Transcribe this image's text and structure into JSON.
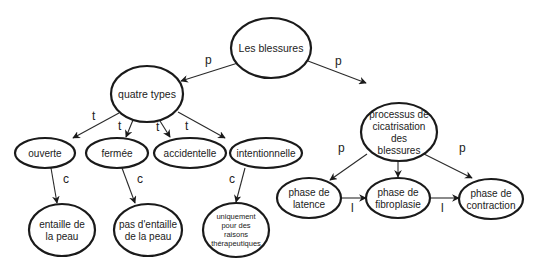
{
  "diagram": {
    "type": "concept-map",
    "nodes": [
      {
        "id": "root",
        "lines": [
          "Les blessures"
        ],
        "cx": 271,
        "cy": 48,
        "rx": 40,
        "ry": 30,
        "fs": 10.5
      },
      {
        "id": "types",
        "lines": [
          "quatre types"
        ],
        "cx": 147,
        "cy": 94,
        "rx": 36,
        "ry": 28,
        "fs": 10.5
      },
      {
        "id": "process",
        "lines": [
          "processus de",
          "cicatrisation",
          "des",
          "blessures"
        ],
        "cx": 399,
        "cy": 132,
        "rx": 38,
        "ry": 29,
        "fs": 10
      },
      {
        "id": "ouverte",
        "lines": [
          "ouverte"
        ],
        "cx": 45,
        "cy": 153,
        "rx": 30,
        "ry": 15,
        "fs": 10
      },
      {
        "id": "fermee",
        "lines": [
          "fermée"
        ],
        "cx": 117,
        "cy": 153,
        "rx": 31,
        "ry": 15,
        "fs": 10
      },
      {
        "id": "accidentelle",
        "lines": [
          "accidentelle"
        ],
        "cx": 190,
        "cy": 153,
        "rx": 36,
        "ry": 15,
        "fs": 10
      },
      {
        "id": "intentionnelle",
        "lines": [
          "intentionnelle"
        ],
        "cx": 266,
        "cy": 153,
        "rx": 36,
        "ry": 15,
        "fs": 10
      },
      {
        "id": "entaille",
        "lines": [
          "entaille de",
          "la peau"
        ],
        "cx": 62,
        "cy": 230,
        "rx": 33,
        "ry": 26,
        "fs": 10
      },
      {
        "id": "pas_entaille",
        "lines": [
          "pas d'entaille",
          "de la peau"
        ],
        "cx": 148,
        "cy": 230,
        "rx": 34,
        "ry": 26,
        "fs": 10
      },
      {
        "id": "therapeutique",
        "lines": [
          "uniquement",
          "pour des",
          "raisons",
          "thérapeutiques"
        ],
        "cx": 236,
        "cy": 230,
        "rx": 33,
        "ry": 27,
        "fs": 7.5
      },
      {
        "id": "latence",
        "lines": [
          "phase de",
          "latence"
        ],
        "cx": 309,
        "cy": 198,
        "rx": 32,
        "ry": 20,
        "fs": 10
      },
      {
        "id": "fibroplasie",
        "lines": [
          "phase de",
          "fibroplasie"
        ],
        "cx": 398,
        "cy": 198,
        "rx": 32,
        "ry": 20,
        "fs": 10
      },
      {
        "id": "contraction",
        "lines": [
          "phase de",
          "contraction"
        ],
        "cx": 491,
        "cy": 199,
        "rx": 32,
        "ry": 20,
        "fs": 10
      }
    ],
    "edges": [
      {
        "from": "root",
        "to": "types",
        "label": "p",
        "x1": 241,
        "y1": 62,
        "x2": 181,
        "y2": 81,
        "lx": 205,
        "ly": 64
      },
      {
        "from": "root",
        "to": "process",
        "label": "p",
        "x1": 308,
        "y1": 61,
        "x2": 366,
        "y2": 83,
        "lx": 335,
        "ly": 65
      },
      {
        "from": "types",
        "to": "ouverte",
        "label": "t",
        "x1": 119,
        "y1": 113,
        "x2": 73,
        "y2": 138,
        "lx": 92,
        "ly": 120
      },
      {
        "from": "types",
        "to": "fermee",
        "label": "t",
        "x1": 133,
        "y1": 120,
        "x2": 126,
        "y2": 137,
        "lx": 118,
        "ly": 130
      },
      {
        "from": "types",
        "to": "accidentelle",
        "label": "t",
        "x1": 160,
        "y1": 121,
        "x2": 170,
        "y2": 137,
        "lx": 156,
        "ly": 131
      },
      {
        "from": "types",
        "to": "intentionnelle",
        "label": "t",
        "x1": 178,
        "y1": 112,
        "x2": 225,
        "y2": 138,
        "lx": 185,
        "ly": 130
      },
      {
        "from": "ouverte",
        "to": "entaille",
        "label": "c",
        "x1": 51,
        "y1": 168,
        "x2": 57,
        "y2": 203,
        "lx": 63,
        "ly": 183
      },
      {
        "from": "fermee",
        "to": "pas_entaille",
        "label": "c",
        "x1": 122,
        "y1": 168,
        "x2": 135,
        "y2": 203,
        "lx": 137,
        "ly": 183
      },
      {
        "from": "intentionnelle",
        "to": "therapeutique",
        "label": "c",
        "x1": 245,
        "y1": 168,
        "x2": 236,
        "y2": 202,
        "lx": 229,
        "ly": 183
      },
      {
        "from": "process",
        "to": "latence",
        "label": "p",
        "x1": 367,
        "y1": 154,
        "x2": 330,
        "y2": 180,
        "lx": 338,
        "ly": 152
      },
      {
        "from": "process",
        "to": "fibroplasie",
        "label": "p",
        "x1": 398,
        "y1": 161,
        "x2": 398,
        "y2": 177,
        "lx": 390,
        "ly": 152
      },
      {
        "from": "process",
        "to": "contraction",
        "label": "p",
        "x1": 424,
        "y1": 154,
        "x2": 472,
        "y2": 178,
        "lx": 459,
        "ly": 152
      },
      {
        "from": "latence",
        "to": "fibroplasie",
        "label": "l",
        "x1": 341,
        "y1": 198,
        "x2": 366,
        "y2": 198,
        "lx": 351,
        "ly": 212
      },
      {
        "from": "fibroplasie",
        "to": "contraction",
        "label": "l",
        "x1": 430,
        "y1": 198,
        "x2": 459,
        "y2": 198,
        "lx": 441,
        "ly": 212
      }
    ]
  }
}
